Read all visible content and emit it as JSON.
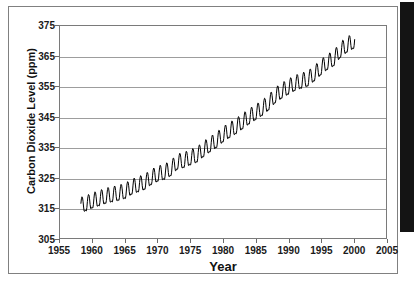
{
  "figure": {
    "background_color": "#ffffff",
    "frame_color": "#808080",
    "plot_border_color": "#7a7a7a",
    "gridline_color": "#9d9d9d",
    "series_color": "#000000",
    "scan_edge_color": "#141414"
  },
  "chart_data": {
    "type": "line",
    "title": "",
    "xlabel": "Year",
    "ylabel": "Carbon Dioxide Level (ppm)",
    "xlim": [
      1955,
      2005
    ],
    "ylim": [
      305,
      375
    ],
    "xticks": [
      1955,
      1960,
      1965,
      1970,
      1975,
      1980,
      1985,
      1990,
      1995,
      2000,
      2005
    ],
    "yticks": [
      305,
      315,
      325,
      335,
      345,
      355,
      365,
      375
    ],
    "xtick_labels": [
      "1955",
      "1960",
      "1965",
      "1970",
      "1975",
      "1980",
      "1985",
      "1990",
      "1995",
      "2000",
      "2005"
    ],
    "ytick_labels": [
      "305",
      "315",
      "325",
      "335",
      "345",
      "355",
      "365",
      "375"
    ],
    "grid": true,
    "grid_axis": "y",
    "legend": false,
    "legend_position": "none",
    "series": [
      {
        "name": "Atmospheric CO2 (Mauna Loa)",
        "color": "#000000",
        "line_width": 1,
        "x_start": 1958.2,
        "x_end": 2000.2,
        "seasonal_amplitude_ppm": 3.1,
        "seasonal_peak_month": 0.38,
        "annual_mean": {
          "x": [
            1958,
            1959,
            1960,
            1961,
            1962,
            1963,
            1964,
            1965,
            1966,
            1967,
            1968,
            1969,
            1970,
            1971,
            1972,
            1973,
            1974,
            1975,
            1976,
            1977,
            1978,
            1979,
            1980,
            1981,
            1982,
            1983,
            1984,
            1985,
            1986,
            1987,
            1988,
            1989,
            1990,
            1991,
            1992,
            1993,
            1994,
            1995,
            1996,
            1997,
            1998,
            1999,
            2000
          ],
          "y": [
            315.3,
            315.9,
            316.9,
            317.6,
            318.4,
            318.9,
            319.4,
            320.0,
            321.4,
            322.2,
            323.0,
            324.6,
            325.7,
            326.3,
            327.5,
            329.7,
            330.2,
            331.1,
            332.0,
            333.8,
            335.4,
            336.8,
            338.7,
            340.1,
            341.4,
            343.0,
            344.6,
            346.0,
            347.4,
            349.2,
            351.6,
            353.1,
            354.4,
            355.6,
            356.4,
            357.1,
            358.8,
            360.8,
            362.6,
            363.8,
            366.6,
            368.3,
            369.5
          ]
        }
      }
    ],
    "source_note": ""
  }
}
